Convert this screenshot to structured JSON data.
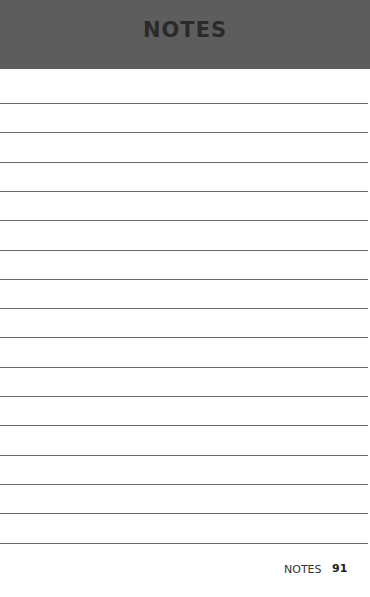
{
  "header": {
    "title": "NOTES"
  },
  "page": {
    "line_count": 16
  },
  "footer": {
    "section_label": "NOTES",
    "page_number": "91"
  }
}
